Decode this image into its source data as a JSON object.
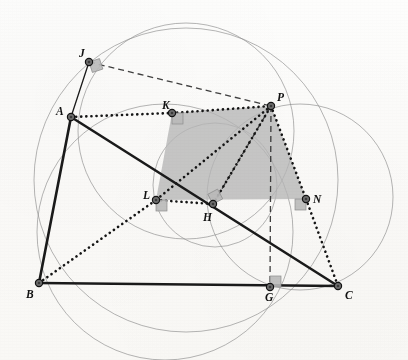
{
  "figure": {
    "width": 408,
    "height": 360,
    "background_color": "#fdfdfb",
    "stroke_color": "#1a1a1a",
    "circle_color": "#8a8a8a",
    "shade_color": "#b5b5b5",
    "marker_fill": "#6e6e6e"
  },
  "points": [
    {
      "id": "A",
      "label": "A",
      "x": 71,
      "y": 117,
      "label_x": 56,
      "label_y": 106,
      "marker": "dot"
    },
    {
      "id": "B",
      "label": "B",
      "x": 39,
      "y": 283,
      "label_x": 26,
      "label_y": 289,
      "marker": "dot"
    },
    {
      "id": "C",
      "label": "C",
      "x": 338,
      "y": 286,
      "label_x": 345,
      "label_y": 290,
      "marker": "dot"
    },
    {
      "id": "G",
      "label": "G",
      "x": 270,
      "y": 287,
      "label_x": 265,
      "label_y": 292,
      "marker": "dot"
    },
    {
      "id": "H",
      "label": "H",
      "x": 213,
      "y": 204,
      "label_x": 203,
      "label_y": 212,
      "marker": "dot"
    },
    {
      "id": "J",
      "label": "J",
      "x": 89,
      "y": 62,
      "label_x": 79,
      "label_y": 48,
      "marker": "dot"
    },
    {
      "id": "K",
      "label": "K",
      "x": 172,
      "y": 113,
      "label_x": 162,
      "label_y": 100,
      "marker": "dot"
    },
    {
      "id": "L",
      "label": "L",
      "x": 156,
      "y": 200,
      "label_x": 143,
      "label_y": 190,
      "marker": "dot"
    },
    {
      "id": "N",
      "label": "N",
      "x": 306,
      "y": 199,
      "label_x": 313,
      "label_y": 194,
      "marker": "dot"
    },
    {
      "id": "P",
      "label": "P",
      "x": 271,
      "y": 106,
      "label_x": 277,
      "label_y": 92,
      "marker": "dot"
    }
  ],
  "solid_segments": [
    {
      "name": "segment-AB",
      "from": "A",
      "to": "B",
      "width": 2.6
    },
    {
      "name": "segment-BC",
      "from": "B",
      "to": "C",
      "width": 2.6
    },
    {
      "name": "segment-AC",
      "from": "A",
      "to": "C",
      "width": 2.6
    },
    {
      "name": "segment-AJ",
      "from": "A",
      "to": "J",
      "width": 1.3
    }
  ],
  "dotted_segments": [
    {
      "name": "segment-AK",
      "from": "A",
      "to": "K"
    },
    {
      "name": "segment-KP",
      "from": "K",
      "to": "P"
    },
    {
      "name": "segment-BL",
      "from": "B",
      "to": "L"
    },
    {
      "name": "segment-LH",
      "from": "L",
      "to": "H"
    },
    {
      "name": "segment-HP",
      "from": "H",
      "to": "P"
    },
    {
      "name": "segment-PN",
      "from": "P",
      "to": "N"
    },
    {
      "name": "segment-NC",
      "from": "N",
      "to": "C"
    },
    {
      "name": "segment-PL",
      "from": "P",
      "to": "L"
    }
  ],
  "dashed_segments": [
    {
      "name": "segment-JP",
      "from": "J",
      "to": "P"
    },
    {
      "name": "segment-PG",
      "from": "P",
      "to": "G"
    },
    {
      "name": "segment-PH-dashed",
      "from": "P",
      "to": "H"
    }
  ],
  "shaded_polygon": {
    "name": "shaded-quadrilateral-KPNL",
    "vertices": [
      "K",
      "P",
      "N",
      "L"
    ],
    "fill": "#b6b6b6",
    "opacity": 0.78
  },
  "right_angle_marks": [
    {
      "name": "right-angle-at-J",
      "x": 89,
      "y": 62,
      "dx": 1,
      "dy": 1,
      "rot": -18
    },
    {
      "name": "right-angle-at-H",
      "x": 213,
      "y": 204,
      "dx": 1,
      "dy": -1,
      "rot": -28
    },
    {
      "name": "right-angle-at-G",
      "x": 270,
      "y": 287,
      "dx": 0,
      "dy": -1,
      "rot": 0
    },
    {
      "name": "right-angle-at-N",
      "x": 306,
      "y": 199,
      "dx": -1,
      "dy": 0,
      "rot": 0
    },
    {
      "name": "right-angle-at-K",
      "x": 172,
      "y": 113,
      "dx": 0,
      "dy": 1,
      "rot": 0
    },
    {
      "name": "right-angle-at-L",
      "x": 156,
      "y": 200,
      "dx": 1,
      "dy": 0,
      "rot": 0
    }
  ],
  "circles": [
    {
      "name": "circumcircle-ABC",
      "cx": 186,
      "cy": 180,
      "r": 152
    },
    {
      "name": "circle-through-J-A-P",
      "cx": 186,
      "cy": 131,
      "r": 108
    },
    {
      "name": "circle-through-B-H-G",
      "cx": 165,
      "cy": 232,
      "r": 128
    },
    {
      "name": "circle-through-P-N-C",
      "cx": 300,
      "cy": 197,
      "r": 93
    },
    {
      "name": "circle-small-through-H-L",
      "cx": 215,
      "cy": 185,
      "r": 62
    }
  ]
}
